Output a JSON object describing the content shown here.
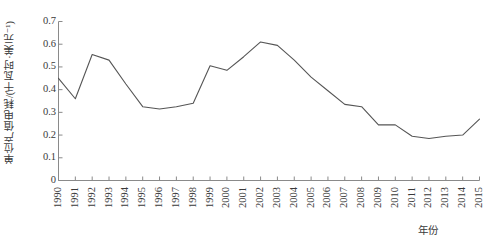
{
  "chart_data": {
    "type": "line",
    "title": "",
    "xlabel": "年份",
    "ylabel": "单位产值电耗/(千瓦时·美元⁻¹)",
    "ylabel_parts": {
      "name": "单位产值电耗",
      "unit": "(千瓦时·美元⁻¹)"
    },
    "categories": [
      "1990",
      "1991",
      "1992",
      "1993",
      "1994",
      "1995",
      "1996",
      "1997",
      "1998",
      "1999",
      "2000",
      "2001",
      "2002",
      "2003",
      "2004",
      "2005",
      "2006",
      "2007",
      "2008",
      "2009",
      "2010",
      "2011",
      "2012",
      "2013",
      "2014",
      "2015"
    ],
    "values": [
      0.45,
      0.36,
      0.555,
      0.53,
      0.425,
      0.325,
      0.315,
      0.325,
      0.34,
      0.505,
      0.485,
      0.545,
      0.61,
      0.595,
      0.53,
      0.455,
      0.395,
      0.335,
      0.325,
      0.245,
      0.245,
      0.195,
      0.185,
      0.195,
      0.2,
      0.27
    ],
    "ylim": [
      0,
      0.7
    ],
    "ytick_values": [
      "0",
      "0.1",
      "0.2",
      "0.3",
      "0.4",
      "0.5",
      "0.6",
      "0.7"
    ],
    "ytick_numbers": [
      0,
      0.1,
      0.2,
      0.3,
      0.4,
      0.5,
      0.6,
      0.7
    ],
    "grid": false,
    "legend": false,
    "legend_position": "none",
    "series": [
      {
        "name": "单位产值电耗",
        "color": "#555555",
        "values": [
          0.45,
          0.36,
          0.555,
          0.53,
          0.425,
          0.325,
          0.315,
          0.325,
          0.34,
          0.505,
          0.485,
          0.545,
          0.61,
          0.595,
          0.53,
          0.455,
          0.395,
          0.335,
          0.325,
          0.245,
          0.245,
          0.195,
          0.185,
          0.195,
          0.2,
          0.27
        ]
      }
    ],
    "axis_color": "#8a8a8a",
    "line_color": "#555555",
    "background": "#ffffff"
  }
}
